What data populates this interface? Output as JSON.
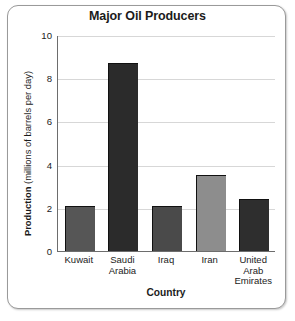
{
  "chart_data": {
    "type": "bar",
    "title": "Major Oil Producers",
    "xlabel": "Country",
    "ylabel_bold": "Production",
    "ylabel_rest": "(millions of barrels per day)",
    "ylabel_full": "Production (millions of barrels per day)",
    "categories": [
      "Kuwait",
      "Saudi Arabia",
      "Iraq",
      "Iran",
      "United Arab Emirates"
    ],
    "category_lines": [
      [
        "Kuwait"
      ],
      [
        "Saudi",
        "Arabia"
      ],
      [
        "Iraq"
      ],
      [
        "Iran"
      ],
      [
        "United",
        "Arab",
        "Emirates"
      ]
    ],
    "values": [
      2.1,
      8.7,
      2.1,
      3.5,
      2.4
    ],
    "bar_colors": [
      "#565656",
      "#2b2b2b",
      "#4a4a4a",
      "#8d8d8d",
      "#2e2e2e"
    ],
    "ylim": [
      0,
      10
    ],
    "yticks": [
      0,
      2,
      4,
      6,
      8,
      10
    ],
    "ytick_labels": [
      "0",
      "2",
      "4",
      "6",
      "8",
      "10"
    ],
    "grid": true,
    "legend": false,
    "axis_color": "#6d6d6d",
    "grid_color": "#d7d7d7",
    "text_color": "#1b1b1b",
    "frame_color": "#9a9a9a",
    "background": "#ffffff"
  }
}
